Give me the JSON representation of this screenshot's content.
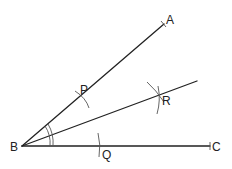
{
  "diagram": {
    "points": {
      "A": {
        "label": "A",
        "x": 164,
        "y": 24
      },
      "B": {
        "label": "B",
        "x": 22,
        "y": 146
      },
      "C": {
        "label": "C",
        "x": 210,
        "y": 146
      },
      "P": {
        "label": "P",
        "x": 82,
        "y": 97
      },
      "Q": {
        "label": "Q",
        "x": 99,
        "y": 146
      },
      "R": {
        "label": "R",
        "x": 158,
        "y": 96
      }
    },
    "rays": [
      "BA",
      "BC",
      "BR"
    ],
    "angle_marks": "double arc at B on both halves"
  }
}
